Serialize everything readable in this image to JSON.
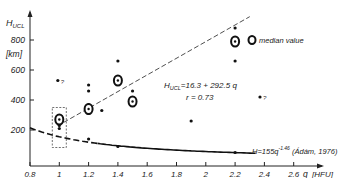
{
  "chart_data": {
    "type": "scatter",
    "title": "",
    "xlabel": "q [HFU]",
    "ylabel": "H_UCL [km]",
    "xlim": [
      0.8,
      2.6
    ],
    "ylim": [
      0,
      900
    ],
    "x_ticks": [
      "0.8",
      "1",
      "1.2",
      "1.4",
      "1.6",
      "1.8",
      "2",
      "2.2",
      "2.4",
      "2.6"
    ],
    "y_ticks": [
      "200",
      "400",
      "600",
      "800"
    ],
    "y_unit": "[km]",
    "x_unit": "[HFU]",
    "grid": false,
    "legend": {
      "position": "top-right",
      "entries": [
        {
          "marker": "open-circle",
          "label": "median value"
        }
      ]
    },
    "estimation_note": "Axis ticks, the regression equation, r, the Adam 1976 curve, and the legend are read directly from the figure. The scatter points and median circles are approximate, back-calculated from pixel positions (about ±0.05 on x, ±30-50 km on y); tight clusters may have the wrong point count.",
    "series": [
      {
        "name": "individual values",
        "marker": "dot",
        "estimated": true,
        "points": [
          {
            "x": 1.0,
            "y": 290
          },
          {
            "x": 1.0,
            "y": 270
          },
          {
            "x": 1.0,
            "y": 250
          },
          {
            "x": 1.0,
            "y": 230
          },
          {
            "x": 1.0,
            "y": 210
          },
          {
            "x": 0.99,
            "y": 530,
            "note": "?"
          },
          {
            "x": 1.2,
            "y": 500
          },
          {
            "x": 1.2,
            "y": 460
          },
          {
            "x": 1.2,
            "y": 370
          },
          {
            "x": 1.2,
            "y": 340
          },
          {
            "x": 1.2,
            "y": 310
          },
          {
            "x": 1.2,
            "y": 140
          },
          {
            "x": 1.29,
            "y": 330
          },
          {
            "x": 1.4,
            "y": 660
          },
          {
            "x": 1.4,
            "y": 540
          },
          {
            "x": 1.4,
            "y": 90
          },
          {
            "x": 1.5,
            "y": 460
          },
          {
            "x": 1.9,
            "y": 260
          },
          {
            "x": 2.2,
            "y": 880
          },
          {
            "x": 2.2,
            "y": 660
          },
          {
            "x": 2.2,
            "y": 50
          },
          {
            "x": 2.37,
            "y": 420,
            "note": "?"
          }
        ]
      },
      {
        "name": "median value",
        "marker": "open-circle",
        "estimated": true,
        "points": [
          {
            "x": 1.0,
            "y": 270
          },
          {
            "x": 1.2,
            "y": 340
          },
          {
            "x": 1.4,
            "y": 530
          },
          {
            "x": 1.5,
            "y": 390
          },
          {
            "x": 2.2,
            "y": 790
          }
        ]
      },
      {
        "name": "regression",
        "type": "line",
        "style": "dashed",
        "equation": "H_UCL = 16.3 + 292.5 q",
        "correlation": "r = 0.73",
        "x_range": [
          1.0,
          2.3
        ]
      },
      {
        "name": "Adam 1976",
        "type": "line",
        "style": "dashed-to-solid",
        "equation": "H = 155 q^-1.46 (Ádám, 1976)",
        "x_range": [
          0.8,
          2.35
        ]
      }
    ],
    "annotations": [
      {
        "text": "H_UCL = 16.3 + 292.5 q",
        "position": "along regression line"
      },
      {
        "text": "r = 0.73",
        "position": "below regression equation"
      },
      {
        "text": "H=155q^-1.46 (Ádám, 1976)",
        "position": "bottom right near curve"
      },
      {
        "text": "?",
        "position": "near outlier at q≈1"
      },
      {
        "text": "?",
        "position": "near outlier at q≈2.37"
      },
      {
        "text": "dashed box",
        "position": "around q=1 cluster"
      }
    ]
  },
  "labels": {
    "y_axis_title": "H",
    "y_axis_sub": "UCL",
    "y_unit": "[km]",
    "x_axis_q": "q",
    "x_unit": "[HFU]",
    "legend": "median value",
    "reg_eq_main": "H",
    "reg_eq_sub": "UCL",
    "reg_eq_rest": "=16.3  + 292.5 q",
    "reg_r": "r = 0.73",
    "adam_main": "H=155q",
    "adam_exp": "-1.46",
    "adam_rest": "(Ádám, 1976)",
    "q1": "?",
    "q2": "?"
  }
}
